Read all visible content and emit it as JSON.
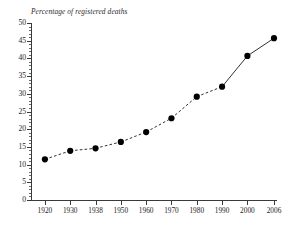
{
  "chart_data": {
    "type": "line",
    "title": "Percentage of registered deaths",
    "xlabel": "",
    "ylabel": "Percentage of registered deaths",
    "x": [
      1920,
      1930,
      1938,
      1950,
      1960,
      1970,
      1980,
      1990,
      2000,
      2006
    ],
    "categories": [
      "1920",
      "1930",
      "1938",
      "1950",
      "1960",
      "1970",
      "1980",
      "1990",
      "2000",
      "2006"
    ],
    "values": [
      11.5,
      13.9,
      14.6,
      16.4,
      19.2,
      23.1,
      29.2,
      32.0,
      40.7,
      45.7
    ],
    "series": [
      {
        "name": "Percentage of registered deaths",
        "values": [
          11.5,
          13.9,
          14.6,
          16.4,
          19.2,
          23.1,
          29.2,
          32.0,
          40.7,
          45.7
        ]
      }
    ],
    "ylim": [
      0,
      50
    ],
    "xlim": [
      1920,
      2006
    ],
    "y_major_ticks": [
      0,
      5,
      10,
      15,
      20,
      25,
      30,
      35,
      40,
      45,
      50
    ],
    "y_tick_labels": [
      "0",
      "5",
      "10",
      "15",
      "20",
      "25",
      "30",
      "35",
      "40",
      "45",
      "50"
    ],
    "y_minor_tick_step": 1,
    "grid": false,
    "legend": "none",
    "marker": "filled-circle",
    "line_style_by_segment": [
      "dashed",
      "dashed",
      "dashed",
      "dashed",
      "dashed",
      "dashed",
      "dashed",
      "solid",
      "solid"
    ],
    "annotations": []
  },
  "chart": {
    "axis_title": "Percentage of registered deaths",
    "y_labels": [
      "50",
      "45",
      "40",
      "35",
      "30",
      "25",
      "20",
      "15",
      "10",
      "5",
      "0"
    ],
    "x_labels": [
      "1920",
      "1930",
      "1938",
      "1950",
      "1960",
      "1970",
      "1980",
      "1990",
      "2000",
      "2006"
    ],
    "colors": {
      "line": "#1a1a1a",
      "marker": "#000000",
      "axis": "#3a3a3a",
      "text": "#1d1d1d",
      "background": "#ffffff"
    }
  }
}
